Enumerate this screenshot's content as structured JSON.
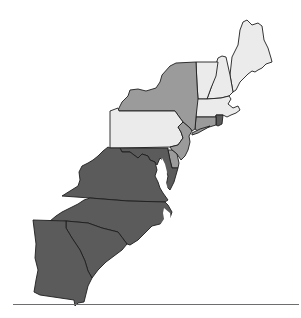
{
  "map": {
    "subject": "Thirteen Colonies",
    "colors": {
      "light": "#ebebeb",
      "medium": "#9b9b9b",
      "dark": "#5b5b5b",
      "outline": "#1e1e1e",
      "background": "#ffffff",
      "rule": "#6e6e6e"
    },
    "regions": [
      {
        "name": "Maine",
        "shade": "light"
      },
      {
        "name": "New Hampshire",
        "shade": "light"
      },
      {
        "name": "Vermont",
        "shade": "light"
      },
      {
        "name": "Massachusetts",
        "shade": "light"
      },
      {
        "name": "Rhode Island",
        "shade": "dark"
      },
      {
        "name": "Connecticut",
        "shade": "medium"
      },
      {
        "name": "New York",
        "shade": "medium"
      },
      {
        "name": "Pennsylvania",
        "shade": "light"
      },
      {
        "name": "New Jersey",
        "shade": "medium"
      },
      {
        "name": "Delaware",
        "shade": "medium"
      },
      {
        "name": "Maryland",
        "shade": "dark"
      },
      {
        "name": "Virginia",
        "shade": "dark"
      },
      {
        "name": "North Carolina",
        "shade": "dark"
      },
      {
        "name": "South Carolina",
        "shade": "dark"
      },
      {
        "name": "Georgia",
        "shade": "dark"
      }
    ]
  }
}
